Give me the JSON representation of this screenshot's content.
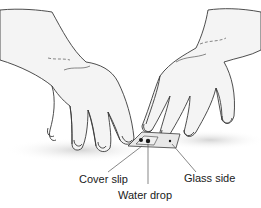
{
  "illustration": {
    "subject": "two hands pressing a cover slip onto a glass slide",
    "labels": [
      {
        "id": "cover-slip",
        "text": "Cover slip"
      },
      {
        "id": "water-drop",
        "text": "Water drop"
      },
      {
        "id": "glass-side",
        "text": "Glass side"
      }
    ],
    "colors": {
      "line": "#3a3a3a",
      "skin_fill": "#f4f4f4",
      "shadow": "#d6d6d6",
      "background": "#ffffff"
    }
  }
}
